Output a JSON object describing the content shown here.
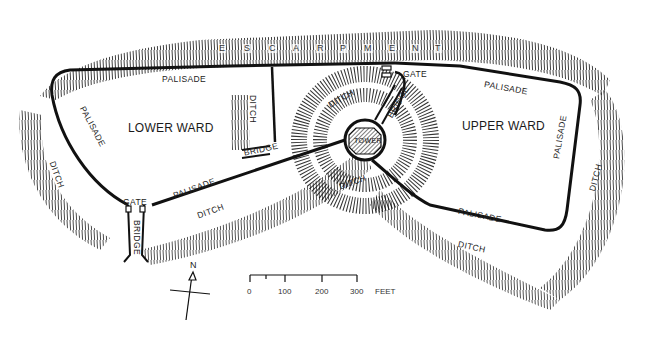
{
  "map": {
    "escarpment_label": [
      "E",
      "S",
      "C",
      "A",
      "R",
      "P",
      "M",
      "E",
      "N",
      "T"
    ],
    "wards": {
      "lower": "LOWER WARD",
      "upper": "UPPER WARD"
    },
    "features": {
      "palisade_top_left": "PALISADE",
      "palisade_top_right": "PALISADE",
      "palisade_left": "PALISADE",
      "palisade_lower_left": "PALISADE",
      "palisade_lower_right": "PALISADE",
      "palisade_right": "PALISADE",
      "ditch_left": "DITCH",
      "ditch_lower_left": "DITCH",
      "ditch_inner": "DITCH",
      "ditch_motte_top": "DITCH",
      "ditch_motte_bottom": "DITCH",
      "ditch_lower_right": "DITCH",
      "ditch_right": "DITCH",
      "gate_top": "GATE",
      "gate_left": "GATE",
      "bridge_motte": "BRIDGE",
      "bridge_inner": "BRIDGE",
      "bridge_left": "BRIDGE",
      "tower": "TOWER"
    },
    "north_arrow": {
      "label": "N"
    },
    "scale_bar": {
      "ticks": [
        "0",
        "100",
        "200",
        "300"
      ],
      "unit": "FEET"
    }
  }
}
